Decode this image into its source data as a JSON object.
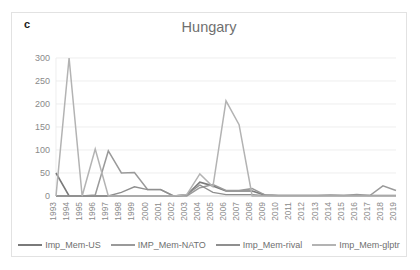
{
  "panel": {
    "label": "c"
  },
  "chart_data": {
    "type": "line",
    "title": "Hungary",
    "xlabel": "",
    "ylabel": "",
    "ylim": [
      0,
      300
    ],
    "yticks": [
      0,
      50,
      100,
      150,
      200,
      250,
      300
    ],
    "grid": true,
    "legend_position": "bottom",
    "categories": [
      "1993",
      "1994",
      "1995",
      "1996",
      "1997",
      "1998",
      "1999",
      "2000",
      "2001",
      "2002",
      "2003",
      "2004",
      "2005",
      "2006",
      "2007",
      "2008",
      "2009",
      "2010",
      "2011",
      "2012",
      "2013",
      "2014",
      "2015",
      "2016",
      "2017",
      "2018",
      "2019"
    ],
    "series": [
      {
        "name": "Imp_Mem-US",
        "color": "#7a7a7a",
        "width": 1.6,
        "values": [
          50,
          0,
          0,
          0,
          0,
          0,
          0,
          0,
          0,
          0,
          2,
          30,
          22,
          11,
          11,
          11,
          2,
          1,
          1,
          1,
          1,
          1,
          1,
          1,
          1,
          1,
          1
        ]
      },
      {
        "name": "IMP_Mem-NATO",
        "color": "#9a9a9a",
        "width": 1.5,
        "values": [
          0,
          0,
          0,
          2,
          98,
          50,
          51,
          14,
          14,
          0,
          0,
          18,
          25,
          12,
          12,
          16,
          2,
          1,
          1,
          1,
          1,
          2,
          1,
          3,
          1,
          22,
          12
        ]
      },
      {
        "name": "Imp_Mem-rival",
        "color": "#8f8f8f",
        "width": 1.3,
        "values": [
          0,
          0,
          0,
          0,
          0,
          8,
          20,
          14,
          14,
          0,
          3,
          24,
          8,
          3,
          3,
          3,
          1,
          1,
          1,
          1,
          1,
          1,
          1,
          1,
          1,
          1,
          1
        ]
      },
      {
        "name": "Imp_Mem-glptr",
        "color": "#b3b3b3",
        "width": 1.5,
        "values": [
          0,
          300,
          0,
          102,
          0,
          0,
          0,
          0,
          0,
          0,
          3,
          48,
          20,
          207,
          155,
          0,
          0,
          0,
          0,
          0,
          0,
          0,
          0,
          0,
          0,
          0,
          0
        ]
      }
    ]
  },
  "legend": {
    "entries": [
      {
        "label": "Imp_Mem-US"
      },
      {
        "label": "IMP_Mem-NATO"
      },
      {
        "label": "Imp_Mem-rival"
      },
      {
        "label": "Imp_Mem-glptr"
      }
    ]
  }
}
